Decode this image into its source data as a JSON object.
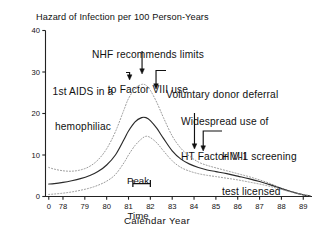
{
  "chart_data": {
    "type": "line",
    "title": "Hazard of Infection per 100 Person-Years",
    "xlabel": "Calendar Year",
    "ylabel": "",
    "xlim": [
      77.2,
      89.4
    ],
    "ylim": [
      0,
      40
    ],
    "grid": false,
    "legend": "none",
    "xticks": [
      "0",
      "78",
      "79",
      "80",
      "81",
      "82",
      "83",
      "84",
      "85",
      "86",
      "87",
      "88",
      "89"
    ],
    "xtick_values": [
      77.35,
      78,
      79,
      80,
      81,
      82,
      83,
      84,
      85,
      86,
      87,
      88,
      89
    ],
    "yticks": [
      "0",
      "10",
      "20",
      "30",
      "40"
    ],
    "ytick_values": [
      0,
      10,
      20,
      30,
      40
    ],
    "x": [
      77.35,
      77.6,
      78.0,
      78.4,
      78.8,
      79.2,
      79.6,
      80.0,
      80.4,
      80.8,
      81.0,
      81.3,
      81.6,
      81.8,
      82.0,
      82.3,
      82.6,
      83.0,
      83.4,
      83.8,
      84.2,
      84.6,
      85.0,
      85.5,
      86.0,
      86.5,
      87.0,
      87.5,
      88.0,
      88.5,
      89.0,
      89.3
    ],
    "series": [
      {
        "name": "Upper 95% confidence limit",
        "style": "dotted",
        "color": "#9a9a9a",
        "values": [
          7.0,
          6.6,
          6.2,
          6.1,
          6.4,
          7.2,
          8.8,
          11.5,
          15.6,
          21.0,
          23.6,
          26.0,
          27.0,
          26.8,
          25.6,
          22.6,
          19.0,
          14.6,
          11.6,
          9.7,
          8.3,
          7.5,
          6.9,
          6.2,
          5.5,
          4.8,
          4.0,
          3.1,
          2.0,
          1.1,
          0.4,
          0.2
        ]
      },
      {
        "name": "Estimated hazard",
        "style": "solid",
        "color": "#2a2a2a",
        "values": [
          3.0,
          3.1,
          3.4,
          3.8,
          4.3,
          5.0,
          6.0,
          7.6,
          10.0,
          13.8,
          15.8,
          18.0,
          19.0,
          19.0,
          18.3,
          16.4,
          14.0,
          11.0,
          9.0,
          7.8,
          7.0,
          6.4,
          6.0,
          5.5,
          4.9,
          4.3,
          3.6,
          2.8,
          1.9,
          1.1,
          0.4,
          0.2
        ]
      },
      {
        "name": "Lower 95% confidence limit",
        "style": "dotted",
        "color": "#9a9a9a",
        "values": [
          0.5,
          0.6,
          0.8,
          1.1,
          1.5,
          2.0,
          2.7,
          3.7,
          5.3,
          8.2,
          10.0,
          12.3,
          13.9,
          14.5,
          14.2,
          12.9,
          11.0,
          8.6,
          7.0,
          6.1,
          5.5,
          5.1,
          4.8,
          4.4,
          4.0,
          3.5,
          3.0,
          2.4,
          1.7,
          1.0,
          0.4,
          0.2
        ]
      }
    ],
    "peak_time": {
      "label_line1": "Peak",
      "label_line2": "Time",
      "from": 81.2,
      "to": 82.0
    },
    "annotations": [
      {
        "id": "nhf",
        "text_line1": "NHF recommends limits",
        "text_line2": "to Factor VIII use",
        "target_x": 81.6
      },
      {
        "id": "first-aids",
        "text_line1": "1st AIDS in a",
        "text_line2": "hemophiliac",
        "target_x": 81.1
      },
      {
        "id": "voluntary-donor",
        "text_line1": "Voluntary donor deferral",
        "text_line2": "",
        "target_x": 82.2
      },
      {
        "id": "ht-factor",
        "text_line1": "Widespread use of",
        "text_line2": "HT Factor VIII",
        "target_x": 84.0
      },
      {
        "id": "hiv-screening",
        "text_line1": "HIV-1 screening",
        "text_line2": "test licensed",
        "target_x": 84.4
      }
    ]
  },
  "colors": {
    "axis": "#222222",
    "text": "#111111",
    "band": "#9a9a9a",
    "line": "#2a2a2a"
  }
}
